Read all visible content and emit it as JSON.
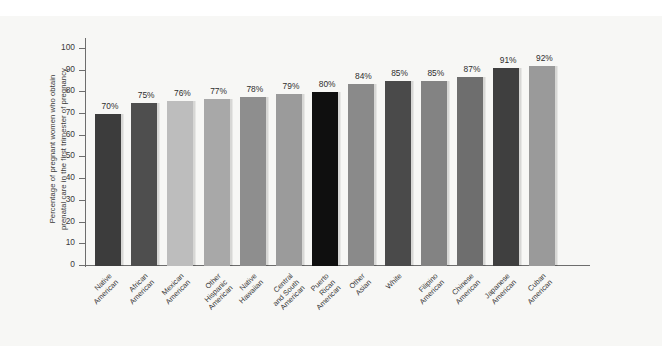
{
  "chart_data": {
    "type": "bar",
    "title": "",
    "subtitle": "",
    "xlabel": "",
    "ylabel": "Percentage of pregnant women who obtain prenatal care in the first trimester of pregnancy",
    "ylabel_lines": [
      "Percentage of pregnant women who obtain",
      "prenatal care in the first trimester of pregnancy"
    ],
    "ylim": [
      0,
      105
    ],
    "ytick_labels": [
      "0",
      "10",
      "20",
      "30",
      "40",
      "50",
      "60",
      "70",
      "80",
      "90",
      "100"
    ],
    "ytick_values": [
      0,
      10,
      20,
      30,
      40,
      50,
      60,
      70,
      80,
      90,
      100
    ],
    "grid": false,
    "legend": "none",
    "categories": [
      "Native American",
      "African American",
      "Mexican American",
      "Other Hispanic American",
      "Native Hawaiian",
      "Central and South American",
      "Puerto Rican American",
      "Other Asian",
      "White",
      "Filipino American",
      "Chinese American",
      "Japanese American",
      "Cuban American"
    ],
    "category_lines": [
      [
        "Native",
        "American"
      ],
      [
        "African",
        "American"
      ],
      [
        "Mexican",
        "American"
      ],
      [
        "Other",
        "Hispanic",
        "American"
      ],
      [
        "Native",
        "Hawaiian"
      ],
      [
        "Central",
        "and South",
        "American"
      ],
      [
        "Puerto",
        "Rican",
        "American"
      ],
      [
        "Other",
        "Asian"
      ],
      [
        "White"
      ],
      [
        "Filipino",
        "American"
      ],
      [
        "Chinese",
        "American"
      ],
      [
        "Japanese",
        "American"
      ],
      [
        "Cuban",
        "American"
      ]
    ],
    "values": [
      70,
      75,
      76,
      77,
      78,
      79,
      80,
      84,
      85,
      85,
      87,
      91,
      92
    ],
    "value_labels": [
      "70%",
      "75%",
      "76%",
      "77%",
      "78%",
      "79%",
      "80%",
      "84%",
      "85%",
      "85%",
      "87%",
      "91%",
      "92%"
    ],
    "bar_colors": [
      "#3c3c3c",
      "#4e4e4e",
      "#bdbdbd",
      "#a8a8a8",
      "#8e8e8e",
      "#9b9b9b",
      "#0f0f0f",
      "#8a8a8a",
      "#4a4a4a",
      "#838383",
      "#6e6e6e",
      "#3f3f3f",
      "#9a9a9a"
    ],
    "background_color": "#f7f7f5",
    "axis_color": "#6d6d6d",
    "text_color": "#3a3a3a"
  }
}
